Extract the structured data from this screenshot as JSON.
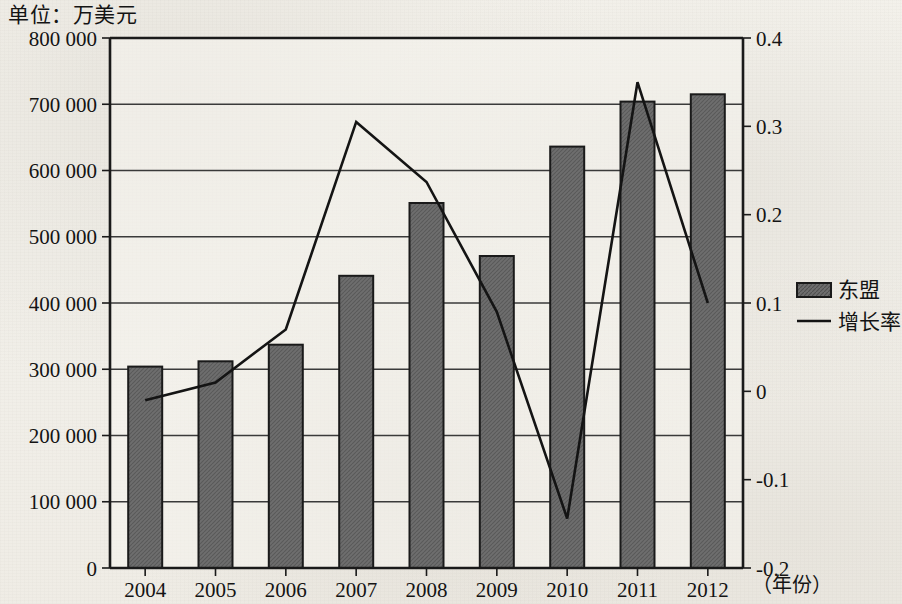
{
  "unit_label": "单位：万美元",
  "axes": {
    "x_axis_name": "（年份）",
    "left_ticks": [
      "0",
      "100 000",
      "200 000",
      "300 000",
      "400 000",
      "500 000",
      "600 000",
      "700 000",
      "800 000"
    ],
    "right_ticks": [
      "-0.2",
      "-0.1",
      "0",
      "0.1",
      "0.2",
      "0.3",
      "0.4"
    ]
  },
  "legend": {
    "bar_label": "东盟",
    "line_label": "增长率"
  },
  "colors": {
    "bar_fill": "#6e6e6e",
    "bar_stroke": "#1a1a1a",
    "line": "#141414",
    "axis": "#1a1a1a",
    "grid": "#3a3a3a",
    "paper": "#f2f0ea"
  },
  "chart_data": {
    "type": "bar",
    "title": "",
    "subtitle": "",
    "xlabel": "（年份）",
    "ylabel": "单位：万美元",
    "categories": [
      "2004",
      "2005",
      "2006",
      "2007",
      "2008",
      "2009",
      "2010",
      "2011",
      "2012"
    ],
    "ylim": [
      0,
      800000
    ],
    "y2lim": [
      -0.2,
      0.4
    ],
    "ytick_step": 100000,
    "y2tick_step": 0.1,
    "grid": true,
    "legend_position": "right",
    "series": [
      {
        "name": "东盟",
        "type": "bar",
        "axis": "left",
        "values": [
          304000,
          312000,
          337000,
          441000,
          551000,
          471000,
          636000,
          704000,
          715000
        ]
      },
      {
        "name": "增长率",
        "type": "line",
        "axis": "right",
        "values": [
          -0.01,
          0.01,
          0.07,
          0.305,
          0.237,
          0.09,
          -0.144,
          0.35,
          0.1
        ]
      }
    ]
  }
}
